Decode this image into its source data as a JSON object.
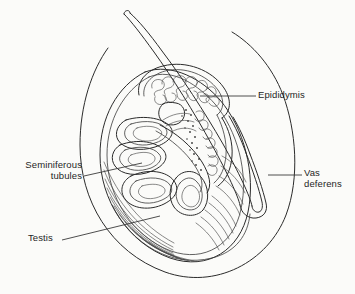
{
  "figure": {
    "background_color": "#fbfbf9",
    "stroke_color": "#2b2b2b",
    "text_color": "#1f1f1f",
    "width": 355,
    "height": 294
  },
  "labels": {
    "epididymis": "Epididymis",
    "seminiferous_tubules": "Seminiferous\ntubules",
    "vas_deferens": "Vas\ndeferens",
    "testis": "Testis"
  },
  "structures": [
    {
      "name": "vas-deferens",
      "label": "Vas deferens",
      "description": "double-walled duct ascending from the epididymis tail"
    },
    {
      "name": "epididymis",
      "label": "Epididymis",
      "description": "convoluted tubule mass capping the superior testis"
    },
    {
      "name": "seminiferous-tubules",
      "label": "Seminiferous tubules",
      "description": "coiled lobular tubules within the testis body"
    },
    {
      "name": "testis",
      "label": "Testis",
      "description": "ovoid organ with tunica albuginea hatching"
    },
    {
      "name": "scrotal-outline",
      "label": "Scrotal sac outline",
      "description": "outer enclosing contour"
    }
  ]
}
